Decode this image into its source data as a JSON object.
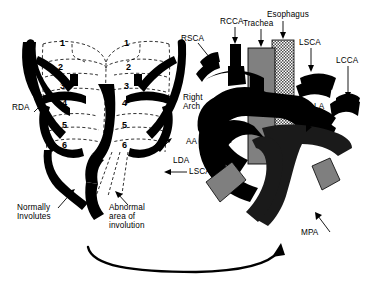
{
  "figure": {
    "panels": [
      {
        "id": "left",
        "name": "Embryonic double aortic arch with numbered pharyngeal arches"
      },
      {
        "id": "right",
        "name": "Right aortic arch with aberrant left subclavian artery forming a vascular ring"
      }
    ]
  },
  "colors": {
    "vessel": "#000000",
    "trachea_fill": "#808080",
    "esophagus_fill": "#a6a6a6",
    "bronchus_fill": "#7f7f7f",
    "dashed_outline": "#000000",
    "background": "#ffffff",
    "mpa_fill": "#1a1a1a"
  },
  "left_panel": {
    "arch_numbers": [
      "1",
      "2",
      "3",
      "4",
      "5",
      "6"
    ],
    "left_column_numbers": [
      "1",
      "2",
      "3",
      "4",
      "5",
      "6"
    ],
    "right_column_numbers": [
      "1",
      "2",
      "3",
      "4",
      "5",
      "6"
    ],
    "labels": [
      {
        "key": "rda",
        "text": "RDA",
        "arrow": "up-right"
      },
      {
        "key": "lda",
        "text": "LDA",
        "arrow": "up-left"
      },
      {
        "key": "lsca",
        "text": "LSCA",
        "arrow": "left"
      },
      {
        "key": "normally_involutes",
        "line1": "Normally",
        "line2": "Involutes",
        "arrow": "up-right"
      },
      {
        "key": "abnormal_area",
        "line1": "Abnormal",
        "line2": "area of",
        "line3": "involution",
        "arrow": "up-left"
      }
    ]
  },
  "right_panel": {
    "labels": [
      {
        "key": "rsca",
        "text": "RSCA",
        "arrow": "down-right"
      },
      {
        "key": "rcca",
        "text": "RCCA",
        "arrow": "down"
      },
      {
        "key": "trachea",
        "text": "Trachea",
        "arrow": "down"
      },
      {
        "key": "esophagus",
        "text": "Esophagus",
        "arrow": "down"
      },
      {
        "key": "lsca",
        "text": "LSCA",
        "arrow": "down"
      },
      {
        "key": "lcca",
        "text": "LCCA",
        "arrow": "down"
      },
      {
        "key": "la",
        "text": "LA",
        "arrow": "down-left"
      },
      {
        "key": "right_arch",
        "line1": "Right",
        "line2": "Arch",
        "arrow": "right"
      },
      {
        "key": "aa",
        "text": "AA",
        "arrow": "right"
      },
      {
        "key": "mpa",
        "text": "MPA",
        "arrow": "up-right"
      }
    ]
  },
  "connector": {
    "name": "progression-arrow",
    "direction": "left-to-right-curved-up"
  }
}
